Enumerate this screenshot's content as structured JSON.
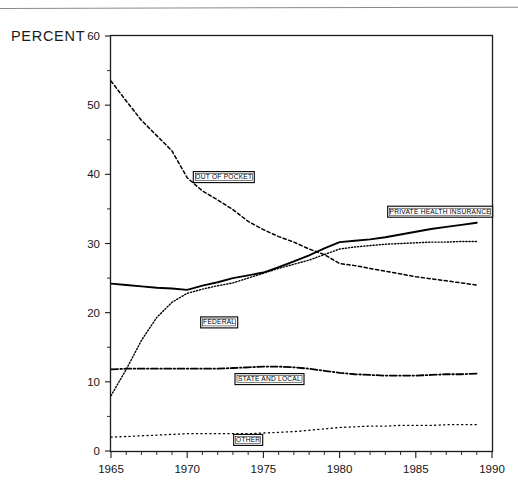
{
  "page": {
    "percent_label": "PERCENT",
    "top_rule": "horizontal-rule"
  },
  "chart_data": {
    "type": "line",
    "title": "",
    "subtitle": "",
    "xlabel": "",
    "ylabel": "PERCENT",
    "xlim": [
      1965,
      1990
    ],
    "ylim": [
      0,
      60
    ],
    "grid": false,
    "legend_position": "inline-boxed-labels",
    "x_ticks": [
      1965,
      1970,
      1975,
      1980,
      1985,
      1990
    ],
    "x_tick_labels": [
      "1965",
      "1970",
      "1975",
      "1980",
      "1985",
      "1990"
    ],
    "x_minor_tick_step": 1,
    "y_ticks": [
      0,
      10,
      20,
      30,
      40,
      50,
      60
    ],
    "y_tick_labels": [
      "0",
      "10",
      "20",
      "30",
      "40",
      "50",
      "60"
    ],
    "y_minor_ticks": [
      5,
      15,
      25,
      35,
      45,
      55
    ],
    "x": [
      1965,
      1966,
      1967,
      1968,
      1969,
      1970,
      1971,
      1972,
      1973,
      1974,
      1975,
      1976,
      1977,
      1978,
      1979,
      1980,
      1981,
      1982,
      1983,
      1984,
      1985,
      1986,
      1987,
      1988,
      1989
    ],
    "series": [
      {
        "name": "OUT OF POCKET",
        "label": "OUT OF POCKET",
        "style": "dashed",
        "color": "#000000",
        "label_x": 1972.4,
        "label_y": 39.6,
        "values": [
          53.5,
          50.6,
          47.8,
          45.6,
          43.4,
          39.5,
          37.6,
          36.3,
          34.9,
          33.2,
          32.0,
          31.0,
          30.2,
          29.2,
          28.4,
          27.1,
          26.8,
          26.4,
          26.0,
          25.6,
          25.2,
          24.9,
          24.6,
          24.3,
          24.0
        ]
      },
      {
        "name": "PRIVATE HEALTH INSURANCE",
        "label": "PRIVATE HEALTH INSURANCE",
        "style": "solid",
        "color": "#000000",
        "label_x": 1986.6,
        "label_y": 34.6,
        "values": [
          24.2,
          24.0,
          23.8,
          23.6,
          23.5,
          23.3,
          23.9,
          24.4,
          25.0,
          25.4,
          25.8,
          26.6,
          27.4,
          28.3,
          29.3,
          30.2,
          30.4,
          30.6,
          30.9,
          31.3,
          31.7,
          32.1,
          32.4,
          32.7,
          33.0
        ]
      },
      {
        "name": "FEDERAL",
        "label": "FEDERAL",
        "style": "dotted",
        "color": "#000000",
        "label_x": 1972.1,
        "label_y": 18.6,
        "values": [
          8.0,
          11.8,
          16.0,
          19.3,
          21.5,
          22.8,
          23.4,
          23.9,
          24.3,
          25.0,
          25.7,
          26.4,
          27.0,
          27.6,
          28.4,
          29.2,
          29.5,
          29.7,
          29.9,
          30.0,
          30.1,
          30.2,
          30.2,
          30.3,
          30.3
        ]
      },
      {
        "name": "STATE AND LOCAL",
        "label": "STATE AND LOCAL",
        "style": "dash-dot",
        "color": "#000000",
        "label_x": 1975.4,
        "label_y": 10.4,
        "values": [
          11.8,
          11.9,
          11.9,
          11.9,
          11.9,
          11.9,
          11.9,
          11.9,
          12.0,
          12.1,
          12.2,
          12.2,
          12.1,
          11.9,
          11.6,
          11.3,
          11.1,
          11.0,
          10.9,
          10.9,
          10.9,
          11.0,
          11.1,
          11.1,
          11.2
        ]
      },
      {
        "name": "OTHER",
        "label": "OTHER",
        "style": "fine-dotted",
        "color": "#000000",
        "label_x": 1974.0,
        "label_y": 1.6,
        "values": [
          2.0,
          2.1,
          2.2,
          2.3,
          2.4,
          2.5,
          2.5,
          2.5,
          2.5,
          2.5,
          2.6,
          2.7,
          2.8,
          3.0,
          3.2,
          3.4,
          3.5,
          3.6,
          3.6,
          3.7,
          3.7,
          3.7,
          3.8,
          3.8,
          3.8
        ]
      }
    ]
  }
}
